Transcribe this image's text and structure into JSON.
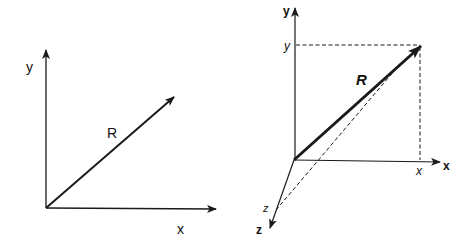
{
  "left_diagram": {
    "axis_y_label": "y",
    "axis_x_label": "x",
    "vector_label": "R"
  },
  "right_diagram": {
    "axis_y_label": "y",
    "axis_x_label": "x",
    "axis_z_label": "z",
    "component_y_label": "y",
    "component_x_label": "x",
    "component_z_label": "z",
    "vector_label": "R"
  },
  "colors": {
    "stroke": "#1a1a1a",
    "background": "#ffffff"
  }
}
